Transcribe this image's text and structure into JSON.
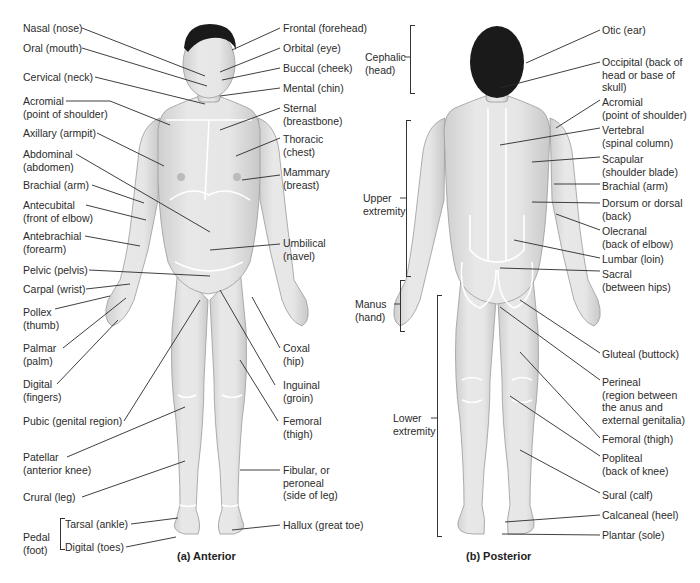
{
  "anterior": {
    "caption": "(a)  Anterior",
    "left_labels": [
      {
        "id": "nasal",
        "lines": [
          "Nasal (nose)"
        ]
      },
      {
        "id": "oral",
        "lines": [
          "Oral (mouth)"
        ]
      },
      {
        "id": "cervical",
        "lines": [
          "Cervical (neck)"
        ]
      },
      {
        "id": "acromial",
        "lines": [
          "Acromial",
          "(point of shoulder)"
        ]
      },
      {
        "id": "axillary",
        "lines": [
          "Axillary (armpit)"
        ]
      },
      {
        "id": "abdominal",
        "lines": [
          "Abdominal",
          "(abdomen)"
        ]
      },
      {
        "id": "brachial",
        "lines": [
          "Brachial (arm)"
        ]
      },
      {
        "id": "antecubital",
        "lines": [
          "Antecubital",
          "(front of elbow)"
        ]
      },
      {
        "id": "antebrachial",
        "lines": [
          "Antebrachial",
          "(forearm)"
        ]
      },
      {
        "id": "pelvic",
        "lines": [
          "Pelvic (pelvis)"
        ]
      },
      {
        "id": "carpal",
        "lines": [
          "Carpal (wrist)"
        ]
      },
      {
        "id": "pollex",
        "lines": [
          "Pollex",
          "(thumb)"
        ]
      },
      {
        "id": "palmar",
        "lines": [
          "Palmar",
          "(palm)"
        ]
      },
      {
        "id": "digital",
        "lines": [
          "Digital",
          "(fingers)"
        ]
      },
      {
        "id": "pubic",
        "lines": [
          "Pubic (genital region)"
        ]
      },
      {
        "id": "patellar",
        "lines": [
          "Patellar",
          "(anterior knee)"
        ]
      },
      {
        "id": "crural",
        "lines": [
          "Crural (leg)"
        ]
      }
    ],
    "pedal": {
      "group_lines": [
        "Pedal",
        "(foot)"
      ],
      "tarsal": "Tarsal (ankle)",
      "digital": "Digital (toes)"
    },
    "right_labels": [
      {
        "id": "frontal",
        "lines": [
          "Frontal (forehead)"
        ]
      },
      {
        "id": "orbital",
        "lines": [
          "Orbital (eye)"
        ]
      },
      {
        "id": "buccal",
        "lines": [
          "Buccal (cheek)"
        ]
      },
      {
        "id": "mental",
        "lines": [
          "Mental (chin)"
        ]
      },
      {
        "id": "sternal",
        "lines": [
          "Sternal",
          "(breastbone)"
        ]
      },
      {
        "id": "thoracic",
        "lines": [
          "Thoracic",
          "(chest)"
        ]
      },
      {
        "id": "mammary",
        "lines": [
          "Mammary",
          "(breast)"
        ]
      },
      {
        "id": "umbilical",
        "lines": [
          "Umbilical",
          "(navel)"
        ]
      },
      {
        "id": "coxal",
        "lines": [
          "Coxal",
          "(hip)"
        ]
      },
      {
        "id": "inguinal",
        "lines": [
          "Inguinal",
          "(groin)"
        ]
      },
      {
        "id": "femoral",
        "lines": [
          "Femoral",
          "(thigh)"
        ]
      },
      {
        "id": "fibular",
        "lines": [
          "Fibular, or",
          "peroneal",
          "(side of leg)"
        ]
      },
      {
        "id": "hallux",
        "lines": [
          "Hallux (great toe)"
        ]
      }
    ]
  },
  "posterior": {
    "caption": "(b)  Posterior",
    "left_groups": [
      {
        "id": "cephalic",
        "lines": [
          "Cephalic",
          "(head)"
        ]
      },
      {
        "id": "upper_extremity",
        "lines": [
          "Upper",
          "extremity"
        ]
      },
      {
        "id": "manus",
        "lines": [
          "Manus",
          "(hand)"
        ]
      },
      {
        "id": "lower_extremity",
        "lines": [
          "Lower",
          "extremity"
        ]
      }
    ],
    "right_labels": [
      {
        "id": "otic",
        "lines": [
          "Otic (ear)"
        ]
      },
      {
        "id": "occipital",
        "lines": [
          "Occipital (back of",
          "head or base of",
          "skull)"
        ]
      },
      {
        "id": "acromial_p",
        "lines": [
          "Acromial",
          "(point of shoulder)"
        ]
      },
      {
        "id": "vertebral",
        "lines": [
          "Vertebral",
          "(spinal column)"
        ]
      },
      {
        "id": "scapular",
        "lines": [
          "Scapular",
          "(shoulder blade)"
        ]
      },
      {
        "id": "brachial_p",
        "lines": [
          "Brachial (arm)"
        ]
      },
      {
        "id": "dorsum",
        "lines": [
          "Dorsum or dorsal",
          "(back)"
        ]
      },
      {
        "id": "olecranal",
        "lines": [
          "Olecranal",
          "(back of elbow)"
        ]
      },
      {
        "id": "lumbar",
        "lines": [
          "Lumbar (loin)"
        ]
      },
      {
        "id": "sacral",
        "lines": [
          "Sacral",
          "(between hips)"
        ]
      },
      {
        "id": "gluteal",
        "lines": [
          "Gluteal (buttock)"
        ]
      },
      {
        "id": "perineal",
        "lines": [
          "Perineal",
          "(region between",
          "the anus and",
          "external genitalia)"
        ]
      },
      {
        "id": "femoral_p",
        "lines": [
          "Femoral (thigh)"
        ]
      },
      {
        "id": "popliteal",
        "lines": [
          "Popliteal",
          "(back of knee)"
        ]
      },
      {
        "id": "sural",
        "lines": [
          "Sural (calf)"
        ]
      },
      {
        "id": "calcaneal",
        "lines": [
          "Calcaneal (heel)"
        ]
      },
      {
        "id": "plantar",
        "lines": [
          "Plantar (sole)"
        ]
      }
    ]
  },
  "colors": {
    "skin": "#e4e4e4",
    "skin_shade": "#c9c9c9",
    "hair": "#1a1a1a",
    "region_line": "#ffffff",
    "leader": "#2a2a2a"
  }
}
